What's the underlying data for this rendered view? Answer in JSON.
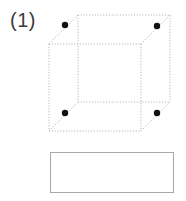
{
  "page": {
    "width": 186,
    "height": 201,
    "background": "#ffffff"
  },
  "problem": {
    "label": "(1)",
    "label_color": "#3b3b3b"
  },
  "figure": {
    "name": "cube-with-marked-vertices",
    "type": "wireframe-cube",
    "edge_style": "dotted",
    "edge_color": "#b4b4b4",
    "edge_width": 1,
    "dot_color": "#111111",
    "dot_radius": 3.2,
    "front_face": {
      "x1": 49,
      "y1": 44,
      "x2": 141,
      "y2": 131
    },
    "back_face": {
      "x1": 78,
      "y1": 15,
      "x2": 170,
      "y2": 102
    },
    "vertices": {
      "front_top_left": {
        "x": 49,
        "y": 44
      },
      "front_top_right": {
        "x": 141,
        "y": 44
      },
      "front_bottom_left": {
        "x": 49,
        "y": 131
      },
      "front_bottom_right": {
        "x": 141,
        "y": 131
      },
      "back_top_left": {
        "x": 78,
        "y": 15
      },
      "back_top_right": {
        "x": 170,
        "y": 15
      },
      "back_bottom_left": {
        "x": 78,
        "y": 102
      },
      "back_bottom_right": {
        "x": 170,
        "y": 102
      }
    },
    "marked_points": [
      {
        "name": "dot-top-left",
        "x": 65,
        "y": 25
      },
      {
        "name": "dot-top-right",
        "x": 157,
        "y": 26
      },
      {
        "name": "dot-bottom-left",
        "x": 65,
        "y": 113
      },
      {
        "name": "dot-bottom-right",
        "x": 157,
        "y": 113
      }
    ]
  },
  "answer_box": {
    "name": "answer-box",
    "value": "",
    "x": 50,
    "y": 152,
    "width": 124,
    "height": 41,
    "border_color": "#a8a8a8",
    "fill": "#ffffff"
  }
}
